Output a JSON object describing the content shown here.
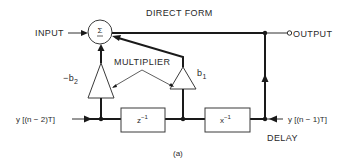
{
  "diagram": {
    "title": "DIRECT FORM",
    "caption": "(a)",
    "input_label": "INPUT",
    "output_label": "OUTPUT",
    "summer_symbol": "Σ",
    "multiplier_label": "MULTIPLIER",
    "coef_left": "−b",
    "coef_left_sub": "2",
    "coef_right": "b",
    "coef_right_sub": "1",
    "delay_box_1_base": "z",
    "delay_box_1_exp": "−1",
    "delay_box_2_base": "x",
    "delay_box_2_exp": "−1",
    "delay_label": "DELAY",
    "left_signal": "y [(n − 2)T]",
    "right_signal": "y [(n − 1)T]"
  }
}
